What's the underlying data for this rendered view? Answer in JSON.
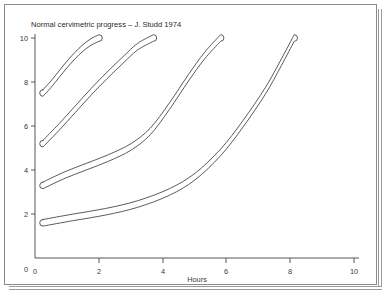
{
  "page": {
    "background_color": "#ffffff",
    "frame_color": "#8a8a8a"
  },
  "chart_data": {
    "type": "line",
    "title": "Normal cervimetric progress – J. Studd 1974",
    "xlabel": "Hours",
    "ylabel": "",
    "xlim": [
      0,
      10.6
    ],
    "ylim": [
      0,
      10.3
    ],
    "xticks": [
      0,
      2,
      4,
      6,
      8,
      10
    ],
    "yticks": [
      0,
      2,
      4,
      6,
      8,
      10
    ],
    "xtick_labels": [
      "0",
      "2",
      "4",
      "6",
      "8",
      "10"
    ],
    "ytick_labels": [
      "0",
      "2",
      "4",
      "6",
      "8",
      "10"
    ],
    "grid": false,
    "legend": null,
    "series_style": "closed-band-envelope",
    "line_color": "#3d3d42",
    "series": [
      {
        "name": "Band 1 (start 7.5 cm)",
        "start_x": 0.25,
        "start_y": 7.5,
        "end_x": 2.0,
        "end_y": 10.0,
        "band_width_cm": 0.3,
        "x": [
          0.25,
          0.5,
          0.75,
          1.0,
          1.25,
          1.5,
          1.75,
          2.0
        ],
        "y": [
          7.5,
          7.9,
          8.35,
          8.8,
          9.2,
          9.55,
          9.82,
          10.0
        ]
      },
      {
        "name": "Band 2 (start 5.2 cm)",
        "start_x": 0.25,
        "start_y": 5.2,
        "end_x": 3.7,
        "end_y": 10.0,
        "band_width_cm": 0.3,
        "x": [
          0.25,
          0.75,
          1.25,
          1.75,
          2.25,
          2.75,
          3.2,
          3.7
        ],
        "y": [
          5.2,
          5.95,
          6.75,
          7.55,
          8.3,
          9.0,
          9.6,
          10.0
        ]
      },
      {
        "name": "Band 3 (start 3.3 cm)",
        "start_x": 0.25,
        "start_y": 3.3,
        "end_x": 5.8,
        "end_y": 10.0,
        "band_width_cm": 0.3,
        "x": [
          0.25,
          0.9,
          1.6,
          2.3,
          3.0,
          3.6,
          4.2,
          4.8,
          5.3,
          5.8
        ],
        "y": [
          3.3,
          3.75,
          4.15,
          4.55,
          5.05,
          5.75,
          6.9,
          8.2,
          9.2,
          10.0
        ]
      },
      {
        "name": "Band 4 (start 1.6 cm)",
        "start_x": 0.25,
        "start_y": 1.6,
        "end_x": 8.1,
        "end_y": 10.0,
        "band_width_cm": 0.3,
        "x": [
          0.25,
          1.2,
          2.2,
          3.2,
          4.2,
          5.0,
          5.8,
          6.5,
          7.2,
          7.7,
          8.1
        ],
        "y": [
          1.6,
          1.85,
          2.1,
          2.45,
          3.0,
          3.7,
          4.8,
          6.1,
          7.6,
          8.9,
          10.0
        ]
      }
    ]
  }
}
